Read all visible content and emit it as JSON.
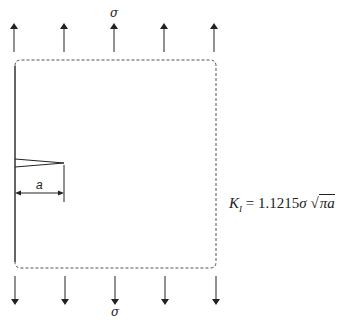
{
  "figure": {
    "top_load_label": "σ",
    "bottom_load_label": "σ",
    "crack_length_label": "a",
    "equation": {
      "lhs_symbol": "K",
      "lhs_subscript": "I",
      "equals": "=",
      "coefficient": "1.1215",
      "stress": "σ",
      "radical_sign": "√",
      "radicand": "πa",
      "full_text": "K_I = 1.1215σ√(πa)"
    },
    "arrow_count_top": 5,
    "arrow_count_bottom": 5,
    "colors": {
      "stroke": "#222222",
      "dashed_border": "#555555"
    }
  }
}
